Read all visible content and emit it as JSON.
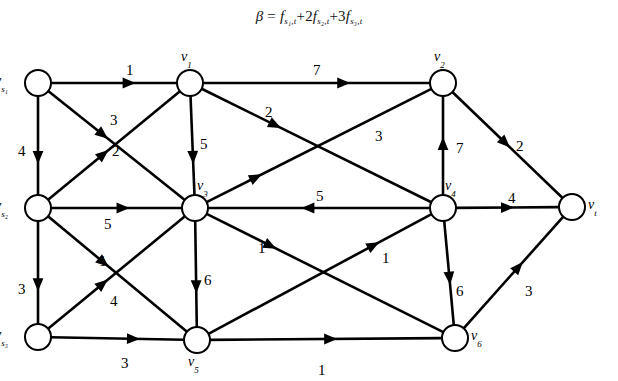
{
  "title": {
    "beta": "β",
    "equals": "=",
    "term1": "f",
    "term1_sub": "s₁,t",
    "plus1": "+",
    "coef2": "2",
    "term2": "f",
    "term2_sub": "s₂,t",
    "plus2": "+",
    "coef3": "3",
    "term3": "f",
    "term3_sub": "s₃,t",
    "full": "β = f(s1,t) + 2f(s2,t) + 3f(s3,t)"
  },
  "graph": {
    "type": "directed-network-flow",
    "nodes": [
      {
        "id": "vs1",
        "label": "v",
        "sub": "s₁",
        "x": 38,
        "y": 83,
        "label_pos": "left"
      },
      {
        "id": "vs2",
        "label": "v",
        "sub": "s₂",
        "x": 38,
        "y": 208,
        "label_pos": "left"
      },
      {
        "id": "vs3",
        "label": "v",
        "sub": "s₃",
        "x": 38,
        "y": 337,
        "label_pos": "left"
      },
      {
        "id": "v1",
        "label": "v",
        "sub": "1",
        "x": 190,
        "y": 83,
        "label_pos": "above"
      },
      {
        "id": "v3",
        "label": "v",
        "sub": "3",
        "x": 195,
        "y": 208,
        "label_pos": "above-right"
      },
      {
        "id": "v5",
        "label": "v",
        "sub": "5",
        "x": 197,
        "y": 340,
        "label_pos": "below"
      },
      {
        "id": "v2",
        "label": "v",
        "sub": "2",
        "x": 443,
        "y": 83,
        "label_pos": "above"
      },
      {
        "id": "v4",
        "label": "v",
        "sub": "4",
        "x": 443,
        "y": 208,
        "label_pos": "above-right"
      },
      {
        "id": "v6",
        "label": "v",
        "sub": "6",
        "x": 455,
        "y": 338,
        "label_pos": "right"
      },
      {
        "id": "vt",
        "label": "v",
        "sub": "t",
        "x": 572,
        "y": 207,
        "label_pos": "right"
      }
    ],
    "edges": [
      {
        "from": "vs1",
        "to": "v1",
        "capacity": "1",
        "lx": 126,
        "ly": 62
      },
      {
        "from": "vs1",
        "to": "vs2",
        "capacity": "4",
        "lx": 18,
        "ly": 143
      },
      {
        "from": "vs1",
        "to": "v3",
        "capacity": "3",
        "lx": 110,
        "ly": 112
      },
      {
        "from": "vs2",
        "to": "v1",
        "capacity": "2",
        "lx": 112,
        "ly": 143
      },
      {
        "from": "vs2",
        "to": "v3",
        "capacity": "5",
        "lx": 104,
        "ly": 216
      },
      {
        "from": "vs2",
        "to": "v5",
        "capacity": "1",
        "lx": 99,
        "ly": 253
      },
      {
        "from": "vs2",
        "to": "vs3",
        "capacity": "3",
        "lx": 18,
        "ly": 281
      },
      {
        "from": "vs3",
        "to": "v3",
        "capacity": "4",
        "lx": 110,
        "ly": 293
      },
      {
        "from": "vs3",
        "to": "v5",
        "capacity": "3",
        "lx": 121,
        "ly": 355
      },
      {
        "from": "v1",
        "to": "v2",
        "capacity": "7",
        "lx": 313,
        "ly": 62
      },
      {
        "from": "v1",
        "to": "v3",
        "capacity": "5",
        "lx": 200,
        "ly": 136
      },
      {
        "from": "v1",
        "to": "v4",
        "capacity": "2",
        "lx": 265,
        "ly": 104
      },
      {
        "from": "v3",
        "to": "v2",
        "capacity": "3",
        "lx": 375,
        "ly": 128
      },
      {
        "from": "v3",
        "to": "v5",
        "capacity": "6",
        "lx": 204,
        "ly": 272
      },
      {
        "from": "v3",
        "to": "v6",
        "capacity": "1",
        "lx": 258,
        "ly": 240
      },
      {
        "from": "v4",
        "to": "v3",
        "capacity": "5",
        "lx": 316,
        "ly": 188
      },
      {
        "from": "v4",
        "to": "v2",
        "capacity": "7",
        "lx": 456,
        "ly": 140
      },
      {
        "from": "v4",
        "to": "vt",
        "capacity": "4",
        "lx": 508,
        "ly": 190
      },
      {
        "from": "v4",
        "to": "v6",
        "capacity": "6",
        "lx": 456,
        "ly": 283
      },
      {
        "from": "v2",
        "to": "vt",
        "capacity": "2",
        "lx": 516,
        "ly": 138
      },
      {
        "from": "v5",
        "to": "v4",
        "capacity": "1",
        "lx": 382,
        "ly": 250
      },
      {
        "from": "v5",
        "to": "v6",
        "capacity": "1",
        "lx": 318,
        "ly": 362
      },
      {
        "from": "v6",
        "to": "vt",
        "capacity": "3",
        "lx": 525,
        "ly": 283
      }
    ]
  }
}
